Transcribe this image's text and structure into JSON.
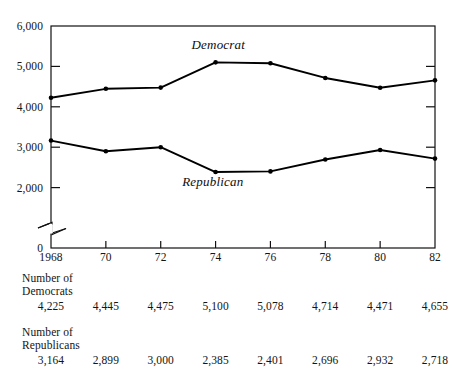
{
  "chart_data": {
    "type": "line",
    "title": "",
    "xlabel": "",
    "ylabel": "",
    "categories": [
      "1968",
      "70",
      "72",
      "74",
      "76",
      "78",
      "80",
      "82"
    ],
    "x": [
      1968,
      1970,
      1972,
      1974,
      1976,
      1978,
      1980,
      1982
    ],
    "series": [
      {
        "name": "Democrat",
        "values": [
          4225,
          4445,
          4475,
          5100,
          5078,
          4714,
          4471,
          4655
        ]
      },
      {
        "name": "Republican",
        "values": [
          3164,
          2899,
          3000,
          2385,
          2401,
          2696,
          2932,
          2718
        ]
      }
    ],
    "ylim": [
      0,
      6000
    ],
    "yticks": [
      2000,
      3000,
      4000,
      5000,
      6000
    ],
    "ytick_labels": [
      "2,000",
      "3,000",
      "4,000",
      "5,000",
      "6,000"
    ],
    "y_zero_label": "0",
    "axis_break": true,
    "axis_break_note": "zigzag break on y-axis between 0 and 2,000",
    "grid": false,
    "legend_position": "inline-annotation",
    "annotations": [
      {
        "text": "Democrat",
        "x": 1974.1,
        "y": 5530
      },
      {
        "text": "Republican",
        "x": 1973.9,
        "y": 2140
      }
    ],
    "marker": "dot",
    "line_color": "#000000",
    "frame": true
  },
  "table": {
    "rows": [
      {
        "label": "Number of\nDemocrats",
        "label_line1": "Number of",
        "label_line2": "Democrats",
        "values": [
          "4,225",
          "4,445",
          "4,475",
          "5,100",
          "5,078",
          "4,714",
          "4,471",
          "4,655"
        ]
      },
      {
        "label": "Number of\nRepublicans",
        "label_line1": "Number of",
        "label_line2": "Republicans",
        "values": [
          "3,164",
          "2,899",
          "3,000",
          "2,385",
          "2,401",
          "2,696",
          "2,932",
          "2,718"
        ]
      }
    ]
  },
  "colors": {
    "ink": "#000000",
    "text": "#141414",
    "background": "#ffffff"
  }
}
